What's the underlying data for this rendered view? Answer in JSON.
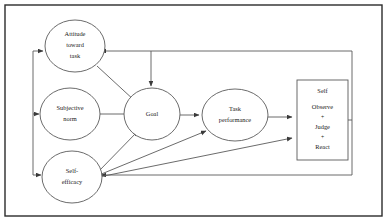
{
  "diagram": {
    "frame": {
      "name": "outer-border",
      "x": 5,
      "y": 5,
      "width": 377,
      "height": 211,
      "stroke_color": "#2b2b2b",
      "fill_color": "#ffffff"
    },
    "nodes": [
      {
        "id": "attitude",
        "shape": "circle",
        "lines": [
          "Attitude",
          "toward",
          "task"
        ],
        "cx": 75,
        "cy": 46,
        "rx": 30,
        "ry": 26
      },
      {
        "id": "subjective_norm",
        "shape": "circle",
        "lines": [
          "Subjective",
          "norm"
        ],
        "cx": 70,
        "cy": 114,
        "rx": 30,
        "ry": 26
      },
      {
        "id": "self_efficacy",
        "shape": "circle",
        "lines": [
          "Self-",
          "efficacy"
        ],
        "cx": 72,
        "cy": 177,
        "rx": 30,
        "ry": 26
      },
      {
        "id": "goal",
        "shape": "circle",
        "lines": [
          "Goal"
        ],
        "cx": 152,
        "cy": 114,
        "rx": 28,
        "ry": 26
      },
      {
        "id": "task_performance",
        "shape": "ellipse",
        "lines": [
          "Task",
          "performance"
        ],
        "cx": 235,
        "cy": 115,
        "rx": 33,
        "ry": 26
      },
      {
        "id": "self_box",
        "shape": "rect",
        "lines": [
          "Self",
          "Observe",
          "+",
          "Judge",
          "+",
          "React"
        ],
        "x": 297,
        "y": 80,
        "width": 51,
        "height": 80
      }
    ],
    "edges": [
      {
        "id": "attitude-to-goal",
        "from": "attitude",
        "to": "goal",
        "type": "diagonal-arrow"
      },
      {
        "id": "subjective-norm-to-goal",
        "from": "subjective_norm",
        "to": "goal",
        "type": "horizontal-arrow"
      },
      {
        "id": "self-efficacy-to-goal",
        "from": "self_efficacy",
        "to": "goal",
        "type": "diagonal-arrow"
      },
      {
        "id": "self-efficacy-to-task-performance",
        "from": "self_efficacy",
        "to": "task_performance",
        "type": "diagonal-arrow"
      },
      {
        "id": "self-efficacy-to-self-box",
        "from": "self_efficacy",
        "to": "self_box",
        "type": "diagonal-arrow"
      },
      {
        "id": "goal-to-task-performance",
        "from": "goal",
        "to": "task_performance",
        "type": "horizontal-arrow"
      },
      {
        "id": "task-performance-to-self-box",
        "from": "task_performance",
        "to": "self_box",
        "type": "horizontal-arrow"
      },
      {
        "id": "self-box-feedback-to-attitude",
        "from": "self_box",
        "to": "attitude",
        "type": "feedback-top"
      },
      {
        "id": "self-box-feedback-to-goal",
        "from": "self_box",
        "to": "goal",
        "type": "feedback-branch-down"
      },
      {
        "id": "self-box-feedback-to-self-efficacy",
        "from": "self_box",
        "to": "self_efficacy",
        "type": "feedback-bottom"
      },
      {
        "id": "left-bus-to-attitude",
        "from": "left-bus",
        "to": "attitude",
        "type": "horizontal-arrow"
      },
      {
        "id": "left-bus-to-subjective-norm",
        "from": "left-bus",
        "to": "subjective_norm",
        "type": "horizontal-arrow"
      },
      {
        "id": "left-bus-to-self-efficacy",
        "from": "left-bus",
        "to": "self_efficacy",
        "type": "horizontal-arrow"
      }
    ]
  }
}
